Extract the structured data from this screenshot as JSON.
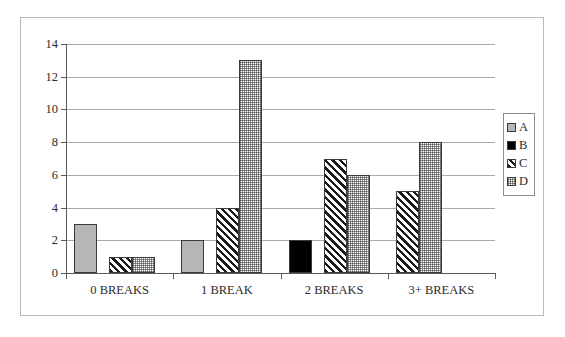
{
  "chart_data": {
    "type": "bar",
    "title": "",
    "subtitle": "",
    "xlabel": "",
    "ylabel": "",
    "categories": [
      "0 BREAKS",
      "1 BREAK",
      "2 BREAKS",
      "3+ BREAKS"
    ],
    "series": [
      {
        "name": "A",
        "values": [
          3,
          2,
          0,
          0
        ],
        "pattern": "solid-gray",
        "color": "#b6b6b6"
      },
      {
        "name": "B",
        "values": [
          0,
          0,
          2,
          0
        ],
        "pattern": "solid-black",
        "color": "#000000"
      },
      {
        "name": "C",
        "values": [
          1,
          4,
          7,
          5
        ],
        "pattern": "diagonal-hatch",
        "color": "#1a1a1a"
      },
      {
        "name": "D",
        "values": [
          1,
          13,
          6,
          8
        ],
        "pattern": "fine-dotted",
        "color": "#6b6b6b"
      }
    ],
    "ylim": [
      0,
      14
    ],
    "yticks": [
      0,
      2,
      4,
      6,
      8,
      10,
      12,
      14
    ],
    "ytick_labels": [
      "0",
      "2",
      "4",
      "6",
      "8",
      "10",
      "12",
      "14"
    ],
    "grid": true,
    "grid_axis": "y",
    "legend_position": "right",
    "legend_entries": [
      "A",
      "B",
      "C",
      "D"
    ]
  }
}
